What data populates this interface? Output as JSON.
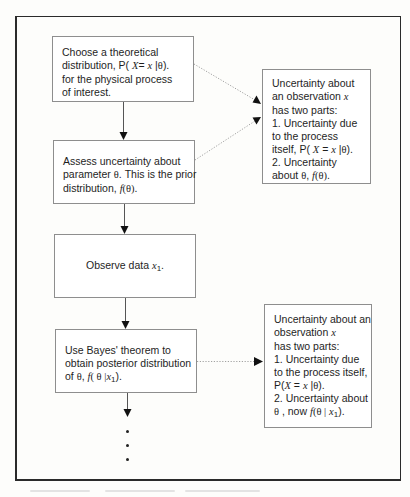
{
  "diagram": {
    "type": "flowchart",
    "steps": [
      {
        "id": "choose-distribution",
        "lines": [
          [
            "Choose a theoretical"
          ],
          [
            "distribution, P( ",
            {
              "m": "X"
            },
            "= ",
            {
              "m": "x"
            },
            " |",
            {
              "r": "θ"
            },
            ")."
          ],
          [
            "for the physical process"
          ],
          [
            "of interest."
          ]
        ],
        "text": "Choose a theoretical distribution, P(X = x | θ), for the physical process of interest."
      },
      {
        "id": "assess-prior",
        "lines": [
          [
            "Assess uncertainty about"
          ],
          [
            "parameter ",
            {
              "r": "θ"
            },
            ".  This is the prior"
          ],
          [
            "distribution, ",
            {
              "m": "f"
            },
            {
              "r": "(θ)"
            },
            "."
          ]
        ],
        "text": "Assess uncertainty about parameter θ. This is the prior distribution, f(θ)."
      },
      {
        "id": "observe-data",
        "lines": [
          [
            "Observe data  ",
            {
              "m": "x"
            },
            {
              "sub": "1"
            },
            "."
          ]
        ],
        "text": "Observe data x1."
      },
      {
        "id": "bayes-theorem",
        "lines": [
          [
            "Use Bayes' theorem to"
          ],
          [
            "obtain posterior distribution"
          ],
          [
            "of ",
            {
              "r": "θ"
            },
            ", ",
            {
              "m": "f"
            },
            {
              "r": "( θ |"
            },
            {
              "m": "x"
            },
            {
              "sub": "1"
            },
            ")."
          ]
        ],
        "text": "Use Bayes' theorem to obtain posterior distribution of θ, f(θ | x1)."
      }
    ],
    "notes": [
      {
        "id": "uncertainty-prior",
        "lines": [
          [
            "Uncertainty about"
          ],
          [
            "an observation  ",
            {
              "m": "x"
            }
          ],
          [
            "has two parts:"
          ],
          [
            "1.  Uncertainty due"
          ],
          [
            "to the process"
          ],
          [
            "itself, P( ",
            {
              "m": "X"
            },
            " =  ",
            {
              "m": "x"
            },
            " |",
            {
              "r": "θ"
            },
            ")."
          ],
          [
            "2.  Uncertainty"
          ],
          [
            "about  ",
            {
              "r": "θ"
            },
            ", ",
            {
              "m": "f"
            },
            {
              "r": "(θ)"
            },
            "."
          ]
        ],
        "text": "Uncertainty about an observation x has two parts: 1. Uncertainty due to the process itself, P(X = x | θ). 2. Uncertainty about θ, f(θ)."
      },
      {
        "id": "uncertainty-posterior",
        "lines": [
          [
            "Uncertainty about an"
          ],
          [
            "observation  ",
            {
              "m": "x"
            }
          ],
          [
            "has two parts:"
          ],
          [
            "1.  Uncertainty due"
          ],
          [
            "to the process itself,"
          ],
          [
            "P(",
            {
              "m": "X"
            },
            "  = ",
            {
              "m": "x"
            },
            "  |",
            {
              "r": "θ"
            },
            ")."
          ],
          [
            "2.  Uncertainty about"
          ],
          [
            {
              "r": "θ"
            },
            " , now  ",
            {
              "m": "f"
            },
            {
              "r": "(θ |"
            },
            " ",
            {
              "m": "x"
            },
            {
              "sub": "1"
            },
            ")."
          ]
        ],
        "text": "Uncertainty about an observation x has two parts: 1. Uncertainty due to the process itself, P(X = x | θ). 2. Uncertainty about θ, now f(θ | x1)."
      }
    ],
    "edges": [
      {
        "from": "choose-distribution",
        "to": "assess-prior",
        "style": "solid"
      },
      {
        "from": "assess-prior",
        "to": "observe-data",
        "style": "solid"
      },
      {
        "from": "observe-data",
        "to": "bayes-theorem",
        "style": "solid"
      },
      {
        "from": "bayes-theorem",
        "to": "continuation",
        "style": "solid"
      },
      {
        "from": "choose-distribution",
        "to": "uncertainty-prior",
        "style": "dotted"
      },
      {
        "from": "assess-prior",
        "to": "uncertainty-prior",
        "style": "dotted"
      },
      {
        "from": "bayes-theorem",
        "to": "uncertainty-posterior",
        "style": "dotted"
      }
    ],
    "continuation_marker": "⋮",
    "colors": {
      "frame": "#2a2a2a",
      "box_border": "#8e8e8e",
      "arrow": "#1a1a1a",
      "dotted_arrow": "#8a8a8a",
      "background": "#fdfdfb"
    }
  }
}
